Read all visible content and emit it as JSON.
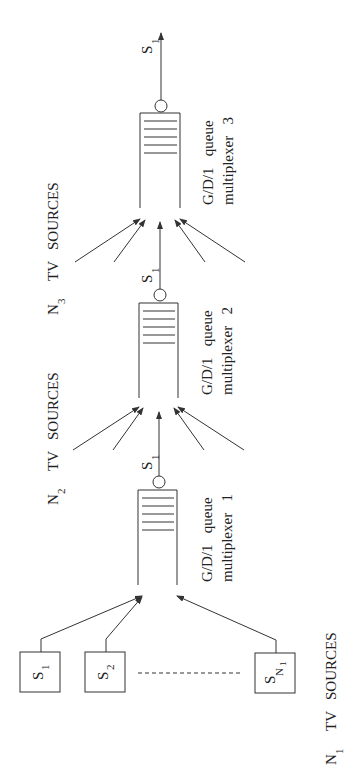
{
  "diagram": {
    "type": "cascaded-multiplexer-network",
    "orientation": "rotated-90-ccw",
    "sources_group_1": {
      "label_main": "N",
      "label_sub": "1",
      "label_rest": "TV   SOURCES",
      "boxes": [
        {
          "main": "S",
          "sub": "1"
        },
        {
          "main": "S",
          "sub": "2"
        },
        {
          "main": "S",
          "sub": "N",
          "subsub": "1"
        }
      ]
    },
    "multiplexers": [
      {
        "line1": "G/D/1   queue",
        "line2": "multiplexer   1",
        "output_main": "S",
        "output_sub": "1"
      },
      {
        "line1": "G/D/1   queue",
        "line2": "multiplexer   2",
        "output_main": "S",
        "output_sub": "1"
      },
      {
        "line1": "G/D/1   queue",
        "line2": "multiplexer   3",
        "output_main": "S",
        "output_sub": "1"
      }
    ],
    "sources_group_2": {
      "label_main": "N",
      "label_sub": "2",
      "label_rest": "TV   SOURCES"
    },
    "sources_group_3": {
      "label_main": "N",
      "label_sub": "3",
      "label_rest": "TV   SOURCES"
    }
  }
}
